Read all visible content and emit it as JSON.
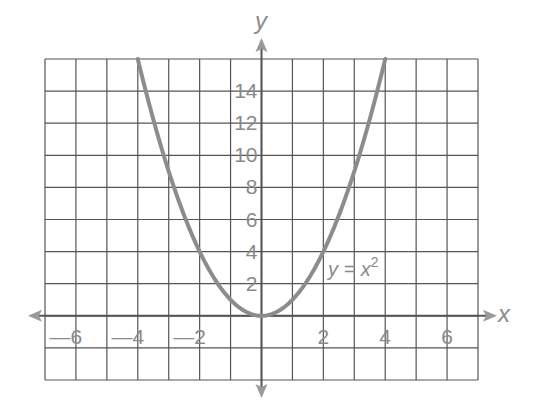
{
  "chart_data": {
    "type": "line",
    "title": "",
    "xlabel": "x",
    "ylabel": "y",
    "xlim": [
      -7,
      7
    ],
    "ylim": [
      -4,
      16
    ],
    "grid": true,
    "grid_x_step": 1,
    "grid_y_step": 2,
    "x_ticks": [
      -6,
      -4,
      -2,
      2,
      4,
      6
    ],
    "x_tick_labels": [
      "—6",
      "—4",
      "—2",
      "2",
      "4",
      "6"
    ],
    "y_ticks": [
      2,
      4,
      6,
      8,
      10,
      12,
      14
    ],
    "y_tick_labels": [
      "2",
      "4",
      "6",
      "8",
      "10",
      "12",
      "14"
    ],
    "series": [
      {
        "name": "y = x²",
        "function": "x^2",
        "x": [
          -4,
          -3,
          -2,
          -1,
          0,
          1,
          2,
          3,
          4
        ],
        "y": [
          16,
          9,
          4,
          1,
          0,
          1,
          4,
          9,
          16
        ],
        "color": "#8c8c8c"
      }
    ],
    "annotations": [
      {
        "text_main": "y = x",
        "superscript": "2",
        "at": [
          2.3,
          2.6
        ]
      }
    ],
    "colors": {
      "grid": "#555555",
      "axis": "#555555",
      "curve": "#8c8c8c",
      "text": "#8a8a8a"
    }
  }
}
